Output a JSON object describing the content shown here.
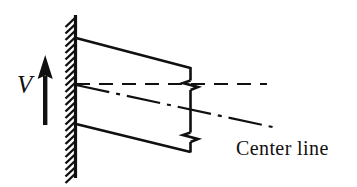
{
  "figure": {
    "type": "engineering-diagram",
    "background_color": "#ffffff",
    "ink_color": "#101010",
    "labels": {
      "velocity": "V",
      "center_line": "Center line"
    },
    "geometry": {
      "wall": {
        "name": "fixed-support-wall",
        "x": 75.5,
        "y_top": 15,
        "y_bottom": 178,
        "hatch_side": "left",
        "hatch_length": 10,
        "hatch_spacing": 6.5,
        "hatch_angle_deg": 48
      },
      "beam_top_edge": {
        "x1": 76,
        "y1": 38,
        "x2": 190,
        "y2": 68
      },
      "beam_bottom_edge": {
        "x1": 76,
        "y1": 124,
        "x2": 190,
        "y2": 152
      },
      "beam_right_end_top": {
        "x": 190,
        "y1": 68,
        "y2": 80
      },
      "beam_right_end_mid": {
        "x": 190,
        "y1": 90,
        "y2": 132
      },
      "beam_right_end_bottom": {
        "x": 190,
        "y1": 142,
        "y2": 152
      },
      "break_symbol_upper": {
        "cx": 190,
        "cy": 85,
        "width": 13,
        "height": 10
      },
      "break_symbol_lower": {
        "cx": 190,
        "cy": 137,
        "width": 13,
        "height": 10
      },
      "dashed_reference_line": {
        "x1": 76,
        "y1": 84,
        "x2": 267,
        "y2": 84,
        "style": "dashed"
      },
      "center_line": {
        "x1": 76,
        "y1": 85,
        "x2": 277,
        "y2": 128,
        "style": "dash-dot"
      },
      "velocity_arrow": {
        "x": 45,
        "y_tail": 125,
        "y_head": 55,
        "shaft_width": 4,
        "head_width": 15,
        "head_height": 22
      }
    }
  }
}
